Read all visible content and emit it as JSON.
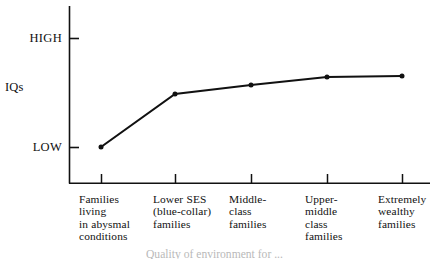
{
  "figure": {
    "background_color": "#ffffff",
    "ink_color": "#111111"
  },
  "axes": {
    "y_axis_title": "IQs",
    "y_tick_labels": {
      "high": "HIGH",
      "low": "LOW"
    }
  },
  "caption": {
    "text": "Quality of environment for ...",
    "note": "partially cut off at bottom edge of image"
  },
  "chart_data": {
    "type": "line",
    "title": "",
    "xlabel": "Quality of environment for ...",
    "ylabel": "IQs",
    "ylim": [
      0,
      1
    ],
    "ytick_positions": [
      0.16,
      0.78
    ],
    "ytick_labels": [
      "LOW",
      "HIGH"
    ],
    "grid": false,
    "legend": null,
    "marker": "filled-circle",
    "line_color": "#111111",
    "categories": [
      "Families\nliving\nin abysmal\nconditions",
      "Lower SES\n(blue-collar)\nfamilies",
      "Middle-\nclass\nfamilies",
      "Upper-\nmiddle\nclass\nfamilies",
      "Extremely\nwealthy\nfamilies"
    ],
    "categories_flat": [
      "Families living in abysmal conditions",
      "Lower SES (blue-collar) families",
      "Middle-class families",
      "Upper-middle class families",
      "Extremely wealthy families"
    ],
    "values": [
      0.16,
      0.46,
      0.51,
      0.56,
      0.57
    ],
    "points_px": [
      {
        "x": 101,
        "y": 147
      },
      {
        "x": 175,
        "y": 94
      },
      {
        "x": 251,
        "y": 85
      },
      {
        "x": 327,
        "y": 77
      },
      {
        "x": 402,
        "y": 76
      }
    ]
  }
}
